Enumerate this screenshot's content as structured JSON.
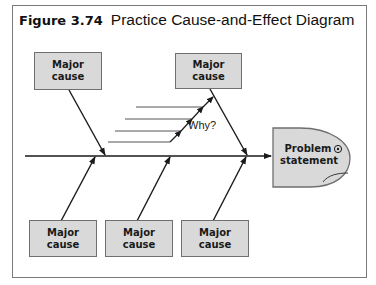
{
  "figure": {
    "number": "Figure 3.74",
    "title": "Practice Cause-and-Effect Diagram"
  },
  "diagram": {
    "type": "fishbone",
    "head": {
      "line1": "Problem",
      "line2": "statement"
    },
    "why_label": "Why?",
    "causes_top": [
      {
        "line1": "Major",
        "line2": "cause"
      },
      {
        "line1": "Major",
        "line2": "cause"
      }
    ],
    "causes_bottom": [
      {
        "line1": "Major",
        "line2": "cause"
      },
      {
        "line1": "Major",
        "line2": "cause"
      },
      {
        "line1": "Major",
        "line2": "cause"
      }
    ],
    "sub_cause_lines": 4,
    "colors": {
      "box_fill": "#d9d9d9",
      "box_border": "#6f6f6f",
      "line": "#1a1a1a",
      "frame": "#7a7a7a"
    }
  }
}
